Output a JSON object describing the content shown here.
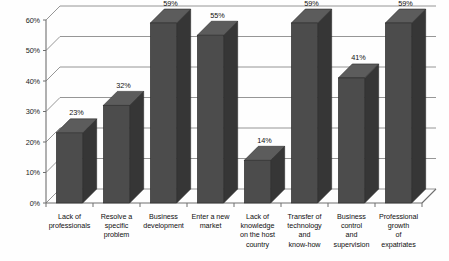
{
  "chart_data": {
    "type": "bar",
    "title": "",
    "subtitle": "",
    "xlabel": "",
    "ylabel": "",
    "grid": true,
    "legend": "none",
    "three_d": true,
    "ylim": [
      0,
      65
    ],
    "ytick_labels": [
      "0%",
      "10%",
      "20%",
      "30%",
      "40%",
      "50%",
      "60%"
    ],
    "ytick_values": [
      0,
      10,
      20,
      30,
      40,
      50,
      60
    ],
    "categories": [
      "Lack of professionals",
      "Resolve a specific problem",
      "Business development",
      "Enter a new market",
      "Lack of knowledge on the host country",
      "Transfer of technology and know-how",
      "Business control and supervision",
      "Professional growth of expatriates"
    ],
    "category_lines": [
      [
        "Lack of",
        "professionals"
      ],
      [
        "Resolve a",
        "specific",
        "problem"
      ],
      [
        "Business",
        "development"
      ],
      [
        "Enter a new",
        "market"
      ],
      [
        "Lack of",
        "knowledge",
        "on the host",
        "country"
      ],
      [
        "Transfer of",
        "technology",
        "and",
        "know-how"
      ],
      [
        "Business",
        "control",
        "and",
        "supervision"
      ],
      [
        "Professional",
        "growth",
        "of",
        "expatriates"
      ]
    ],
    "values": [
      23,
      32,
      59,
      55,
      14,
      59,
      41,
      59
    ],
    "data_labels": [
      "23%",
      "32%",
      "59%",
      "55%",
      "14%",
      "59%",
      "41%",
      "59%"
    ],
    "colors": {
      "bar_front": "#4c4c4c",
      "bar_top": "#5c5c5c",
      "bar_side": "#363636",
      "gridline": "#8a8a8a",
      "axis": "#6f6f6f",
      "background": "#fefefe",
      "text": "#101010"
    }
  }
}
